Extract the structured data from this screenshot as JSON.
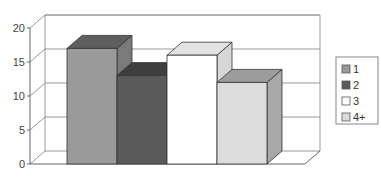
{
  "chart_data": {
    "type": "bar",
    "style": "3d-column",
    "title": "",
    "xlabel": "",
    "ylabel": "",
    "categories": [
      ""
    ],
    "series": [
      {
        "name": "1",
        "values": [
          17
        ],
        "color": "#9a9a9a",
        "top": "#5e5e5e",
        "side": "#7a7a7a"
      },
      {
        "name": "2",
        "values": [
          13
        ],
        "color": "#5a5a5a",
        "top": "#3e3e3e",
        "side": "#4a4a4a"
      },
      {
        "name": "3",
        "values": [
          16
        ],
        "color": "#ffffff",
        "top": "#e2e2e2",
        "side": "#d6d6d6"
      },
      {
        "name": "4+",
        "values": [
          12
        ],
        "color": "#dcdcdc",
        "top": "#9c9c9c",
        "side": "#a8a8a8"
      }
    ],
    "ylim": [
      0,
      20
    ],
    "yticks": [
      "0",
      "5",
      "10",
      "15",
      "20"
    ],
    "grid": true,
    "legend_position": "right"
  }
}
